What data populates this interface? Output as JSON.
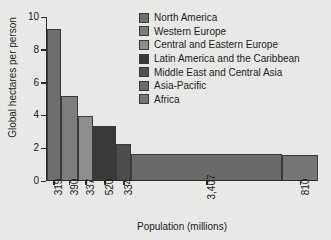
{
  "chart_data": {
    "type": "bar",
    "title": "",
    "subtitle": "",
    "xlabel": "Population (millions)",
    "ylabel": "Global hectares per person",
    "ylim": [
      0,
      10
    ],
    "yticks": [
      0,
      2,
      4,
      6,
      8,
      10
    ],
    "ytick_labels": [
      "0",
      "2",
      "4",
      "6",
      "8",
      "10"
    ],
    "grid": false,
    "legend_position": "top-right",
    "variable_width": true,
    "x_is_cumulative_population": true,
    "xlim": [
      0,
      6117
    ],
    "categories": [
      "North America",
      "Western Europe",
      "Central and Eastern Europe",
      "Latin America and the Caribbean",
      "Middle East and Central Asia",
      "Asia-Pacific",
      "Africa"
    ],
    "xtick_labels": [
      "319",
      "390",
      "337",
      "520",
      "334",
      "3,407",
      "810"
    ],
    "widths": [
      319,
      390,
      337,
      520,
      334,
      3407,
      810
    ],
    "values": [
      9.2,
      5.15,
      3.9,
      3.3,
      2.2,
      1.6,
      1.5
    ],
    "colors": [
      "#6e6e6e",
      "#7d7d7d",
      "#8e8e8e",
      "#3a3a3a",
      "#4d4d4d",
      "#6a6a6a",
      "#757575"
    ],
    "series": [
      {
        "name": "Ecological footprint",
        "points": [
          {
            "label": "North America",
            "population": 319,
            "footprint": 9.2,
            "color": "#6e6e6e"
          },
          {
            "label": "Western Europe",
            "population": 390,
            "footprint": 5.15,
            "color": "#7d7d7d"
          },
          {
            "label": "Central and Eastern Europe",
            "population": 337,
            "footprint": 3.9,
            "color": "#8e8e8e"
          },
          {
            "label": "Latin America and the Caribbean",
            "population": 520,
            "footprint": 3.3,
            "color": "#3a3a3a"
          },
          {
            "label": "Middle East and Central Asia",
            "population": 334,
            "footprint": 2.2,
            "color": "#4d4d4d"
          },
          {
            "label": "Asia-Pacific",
            "population": 3407,
            "footprint": 1.6,
            "color": "#6a6a6a"
          },
          {
            "label": "Africa",
            "population": 810,
            "footprint": 1.5,
            "color": "#757575"
          }
        ]
      }
    ]
  },
  "legend": {
    "items": [
      {
        "label": "North America",
        "color": "#6e6e6e"
      },
      {
        "label": "Western Europe",
        "color": "#7d7d7d"
      },
      {
        "label": "Central and Eastern Europe",
        "color": "#8e8e8e"
      },
      {
        "label": "Latin America and the Caribbean",
        "color": "#3a3a3a"
      },
      {
        "label": "Middle East and Central Asia",
        "color": "#4d4d4d"
      },
      {
        "label": "Asia-Pacific",
        "color": "#6a6a6a"
      },
      {
        "label": "Africa",
        "color": "#757575"
      }
    ]
  },
  "axes": {
    "x_title": "Population (millions)",
    "y_title": "Global hectares per person"
  }
}
